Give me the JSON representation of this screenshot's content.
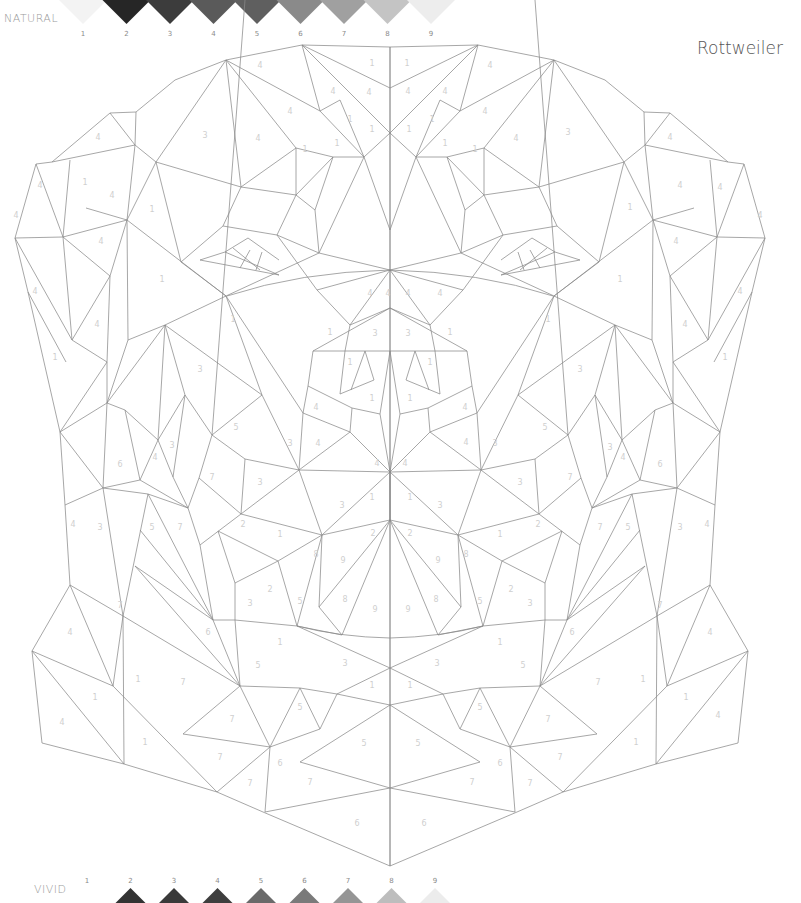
{
  "title": "Rottweiler",
  "palettes": {
    "natural": {
      "label": "NATURAL",
      "swatches": [
        {
          "n": "1",
          "color": "#f3f3f3"
        },
        {
          "n": "2",
          "color": "#262626"
        },
        {
          "n": "3",
          "color": "#3c3c3c"
        },
        {
          "n": "4",
          "color": "#5a5a5a"
        },
        {
          "n": "5",
          "color": "#5f5f5f"
        },
        {
          "n": "6",
          "color": "#8a8a8a"
        },
        {
          "n": "7",
          "color": "#a0a0a0"
        },
        {
          "n": "8",
          "color": "#c4c4c4"
        },
        {
          "n": "9",
          "color": "#ededed"
        }
      ]
    },
    "vivid": {
      "label": "VIVID",
      "swatches": [
        {
          "n": "1",
          "color": "#ffffff"
        },
        {
          "n": "2",
          "color": "#333333"
        },
        {
          "n": "3",
          "color": "#3a3a3a"
        },
        {
          "n": "4",
          "color": "#3e3e3e"
        },
        {
          "n": "5",
          "color": "#6a6a6a"
        },
        {
          "n": "6",
          "color": "#7a7a7a"
        },
        {
          "n": "7",
          "color": "#959595"
        },
        {
          "n": "8",
          "color": "#bdbdbd"
        },
        {
          "n": "9",
          "color": "#ececec"
        }
      ]
    }
  },
  "region_numbers": [
    {
      "x": 260,
      "y": 68,
      "n": "4"
    },
    {
      "x": 372,
      "y": 66,
      "n": "1"
    },
    {
      "x": 407,
      "y": 66,
      "n": "1"
    },
    {
      "x": 490,
      "y": 68,
      "n": "4"
    },
    {
      "x": 98,
      "y": 140,
      "n": "4"
    },
    {
      "x": 205,
      "y": 138,
      "n": "3"
    },
    {
      "x": 568,
      "y": 135,
      "n": "3"
    },
    {
      "x": 670,
      "y": 140,
      "n": "4"
    },
    {
      "x": 333,
      "y": 94,
      "n": "4"
    },
    {
      "x": 369,
      "y": 95,
      "n": "4"
    },
    {
      "x": 408,
      "y": 94,
      "n": "4"
    },
    {
      "x": 445,
      "y": 94,
      "n": "4"
    },
    {
      "x": 290,
      "y": 114,
      "n": "4"
    },
    {
      "x": 485,
      "y": 114,
      "n": "4"
    },
    {
      "x": 258,
      "y": 141,
      "n": "4"
    },
    {
      "x": 516,
      "y": 141,
      "n": "4"
    },
    {
      "x": 350,
      "y": 122,
      "n": "1"
    },
    {
      "x": 372,
      "y": 132,
      "n": "1"
    },
    {
      "x": 409,
      "y": 132,
      "n": "1"
    },
    {
      "x": 432,
      "y": 122,
      "n": "1"
    },
    {
      "x": 305,
      "y": 152,
      "n": "1"
    },
    {
      "x": 337,
      "y": 146,
      "n": "1"
    },
    {
      "x": 445,
      "y": 146,
      "n": "1"
    },
    {
      "x": 475,
      "y": 152,
      "n": "1"
    },
    {
      "x": 40,
      "y": 188,
      "n": "4"
    },
    {
      "x": 85,
      "y": 185,
      "n": "1"
    },
    {
      "x": 152,
      "y": 212,
      "n": "1"
    },
    {
      "x": 112,
      "y": 198,
      "n": "4"
    },
    {
      "x": 680,
      "y": 188,
      "n": "4"
    },
    {
      "x": 720,
      "y": 190,
      "n": "4"
    },
    {
      "x": 630,
      "y": 210,
      "n": "1"
    },
    {
      "x": 16,
      "y": 218,
      "n": "4"
    },
    {
      "x": 760,
      "y": 218,
      "n": "4"
    },
    {
      "x": 101,
      "y": 244,
      "n": "4"
    },
    {
      "x": 676,
      "y": 244,
      "n": "4"
    },
    {
      "x": 162,
      "y": 282,
      "n": "1"
    },
    {
      "x": 620,
      "y": 282,
      "n": "1"
    },
    {
      "x": 35,
      "y": 294,
      "n": "4"
    },
    {
      "x": 740,
      "y": 294,
      "n": "4"
    },
    {
      "x": 97,
      "y": 327,
      "n": "4"
    },
    {
      "x": 685,
      "y": 327,
      "n": "4"
    },
    {
      "x": 55,
      "y": 360,
      "n": "1"
    },
    {
      "x": 725,
      "y": 360,
      "n": "1"
    },
    {
      "x": 200,
      "y": 372,
      "n": "3"
    },
    {
      "x": 580,
      "y": 372,
      "n": "3"
    },
    {
      "x": 233,
      "y": 322,
      "n": "1"
    },
    {
      "x": 548,
      "y": 322,
      "n": "1"
    },
    {
      "x": 330,
      "y": 335,
      "n": "1"
    },
    {
      "x": 450,
      "y": 335,
      "n": "1"
    },
    {
      "x": 375,
      "y": 336,
      "n": "3"
    },
    {
      "x": 408,
      "y": 336,
      "n": "3"
    },
    {
      "x": 370,
      "y": 296,
      "n": "4"
    },
    {
      "x": 388,
      "y": 296,
      "n": "4"
    },
    {
      "x": 408,
      "y": 296,
      "n": "4"
    },
    {
      "x": 440,
      "y": 296,
      "n": "4"
    },
    {
      "x": 350,
      "y": 365,
      "n": "1"
    },
    {
      "x": 430,
      "y": 365,
      "n": "1"
    },
    {
      "x": 372,
      "y": 401,
      "n": "1"
    },
    {
      "x": 410,
      "y": 401,
      "n": "1"
    },
    {
      "x": 316,
      "y": 410,
      "n": "4"
    },
    {
      "x": 465,
      "y": 410,
      "n": "4"
    },
    {
      "x": 318,
      "y": 446,
      "n": "4"
    },
    {
      "x": 466,
      "y": 445,
      "n": "4"
    },
    {
      "x": 377,
      "y": 466,
      "n": "4"
    },
    {
      "x": 405,
      "y": 466,
      "n": "4"
    },
    {
      "x": 290,
      "y": 446,
      "n": "3"
    },
    {
      "x": 495,
      "y": 446,
      "n": "3"
    },
    {
      "x": 236,
      "y": 430,
      "n": "5"
    },
    {
      "x": 545,
      "y": 430,
      "n": "5"
    },
    {
      "x": 212,
      "y": 480,
      "n": "7"
    },
    {
      "x": 570,
      "y": 480,
      "n": "7"
    },
    {
      "x": 260,
      "y": 485,
      "n": "3"
    },
    {
      "x": 520,
      "y": 485,
      "n": "3"
    },
    {
      "x": 120,
      "y": 467,
      "n": "6"
    },
    {
      "x": 660,
      "y": 467,
      "n": "6"
    },
    {
      "x": 155,
      "y": 460,
      "n": "4"
    },
    {
      "x": 172,
      "y": 448,
      "n": "3"
    },
    {
      "x": 610,
      "y": 450,
      "n": "3"
    },
    {
      "x": 623,
      "y": 460,
      "n": "4"
    },
    {
      "x": 152,
      "y": 530,
      "n": "5"
    },
    {
      "x": 180,
      "y": 530,
      "n": "7"
    },
    {
      "x": 600,
      "y": 530,
      "n": "7"
    },
    {
      "x": 628,
      "y": 530,
      "n": "5"
    },
    {
      "x": 73,
      "y": 527,
      "n": "4"
    },
    {
      "x": 100,
      "y": 530,
      "n": "3"
    },
    {
      "x": 680,
      "y": 530,
      "n": "3"
    },
    {
      "x": 707,
      "y": 527,
      "n": "4"
    },
    {
      "x": 243,
      "y": 527,
      "n": "2"
    },
    {
      "x": 280,
      "y": 537,
      "n": "1"
    },
    {
      "x": 500,
      "y": 537,
      "n": "1"
    },
    {
      "x": 538,
      "y": 527,
      "n": "2"
    },
    {
      "x": 342,
      "y": 508,
      "n": "3"
    },
    {
      "x": 440,
      "y": 508,
      "n": "3"
    },
    {
      "x": 372,
      "y": 500,
      "n": "1"
    },
    {
      "x": 410,
      "y": 500,
      "n": "1"
    },
    {
      "x": 316,
      "y": 557,
      "n": "8"
    },
    {
      "x": 343,
      "y": 563,
      "n": "9"
    },
    {
      "x": 438,
      "y": 563,
      "n": "9"
    },
    {
      "x": 466,
      "y": 557,
      "n": "8"
    },
    {
      "x": 373,
      "y": 536,
      "n": "2"
    },
    {
      "x": 410,
      "y": 536,
      "n": "2"
    },
    {
      "x": 270,
      "y": 592,
      "n": "2"
    },
    {
      "x": 511,
      "y": 592,
      "n": "2"
    },
    {
      "x": 300,
      "y": 604,
      "n": "5"
    },
    {
      "x": 345,
      "y": 602,
      "n": "8"
    },
    {
      "x": 375,
      "y": 612,
      "n": "9"
    },
    {
      "x": 408,
      "y": 612,
      "n": "9"
    },
    {
      "x": 436,
      "y": 602,
      "n": "8"
    },
    {
      "x": 480,
      "y": 604,
      "n": "5"
    },
    {
      "x": 250,
      "y": 606,
      "n": "3"
    },
    {
      "x": 530,
      "y": 606,
      "n": "3"
    },
    {
      "x": 120,
      "y": 608,
      "n": "7"
    },
    {
      "x": 660,
      "y": 608,
      "n": "7"
    },
    {
      "x": 208,
      "y": 635,
      "n": "6"
    },
    {
      "x": 572,
      "y": 635,
      "n": "6"
    },
    {
      "x": 70,
      "y": 635,
      "n": "4"
    },
    {
      "x": 710,
      "y": 635,
      "n": "4"
    },
    {
      "x": 280,
      "y": 645,
      "n": "1"
    },
    {
      "x": 500,
      "y": 645,
      "n": "1"
    },
    {
      "x": 258,
      "y": 668,
      "n": "5"
    },
    {
      "x": 523,
      "y": 668,
      "n": "5"
    },
    {
      "x": 345,
      "y": 666,
      "n": "3"
    },
    {
      "x": 437,
      "y": 666,
      "n": "3"
    },
    {
      "x": 183,
      "y": 685,
      "n": "7"
    },
    {
      "x": 598,
      "y": 685,
      "n": "7"
    },
    {
      "x": 138,
      "y": 682,
      "n": "1"
    },
    {
      "x": 643,
      "y": 682,
      "n": "1"
    },
    {
      "x": 95,
      "y": 700,
      "n": "1"
    },
    {
      "x": 686,
      "y": 700,
      "n": "1"
    },
    {
      "x": 62,
      "y": 725,
      "n": "4"
    },
    {
      "x": 718,
      "y": 718,
      "n": "4"
    },
    {
      "x": 372,
      "y": 688,
      "n": "1"
    },
    {
      "x": 410,
      "y": 688,
      "n": "1"
    },
    {
      "x": 300,
      "y": 710,
      "n": "5"
    },
    {
      "x": 480,
      "y": 710,
      "n": "5"
    },
    {
      "x": 232,
      "y": 722,
      "n": "7"
    },
    {
      "x": 548,
      "y": 722,
      "n": "7"
    },
    {
      "x": 145,
      "y": 745,
      "n": "1"
    },
    {
      "x": 636,
      "y": 745,
      "n": "1"
    },
    {
      "x": 364,
      "y": 746,
      "n": "5"
    },
    {
      "x": 418,
      "y": 746,
      "n": "5"
    },
    {
      "x": 220,
      "y": 760,
      "n": "7"
    },
    {
      "x": 560,
      "y": 760,
      "n": "7"
    },
    {
      "x": 280,
      "y": 766,
      "n": "6"
    },
    {
      "x": 500,
      "y": 766,
      "n": "6"
    },
    {
      "x": 250,
      "y": 786,
      "n": "7"
    },
    {
      "x": 530,
      "y": 786,
      "n": "7"
    },
    {
      "x": 310,
      "y": 785,
      "n": "7"
    },
    {
      "x": 472,
      "y": 785,
      "n": "7"
    },
    {
      "x": 357,
      "y": 826,
      "n": "6"
    },
    {
      "x": 424,
      "y": 826,
      "n": "6"
    }
  ]
}
